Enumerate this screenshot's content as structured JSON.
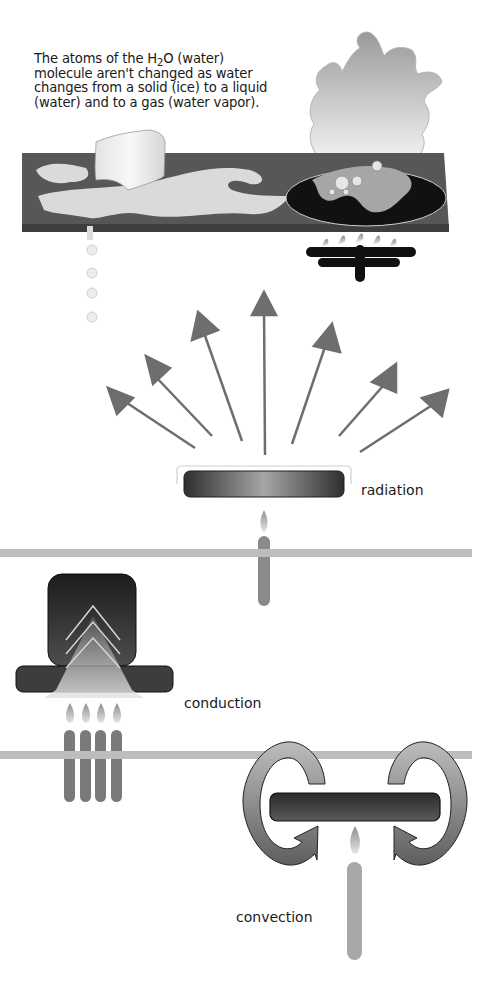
{
  "caption": {
    "prefix": "The atoms of the H",
    "subscript": "2",
    "line1_rest": "O (water)",
    "line2": "molecule aren't changed as water",
    "line3": "changes from a solid (ice) to a liquid",
    "line4": "(water) and to a gas (water vapor)."
  },
  "labels": {
    "radiation": "radiation",
    "conduction": "conduction",
    "convection": "convection"
  },
  "colors": {
    "background": "#ffffff",
    "plank": "#5a5a5a",
    "arrow": "#6e6e6e",
    "candle": "#8a8a8a",
    "shelf_line": "#bdbdbd",
    "dark_plate": "#2a2a2a"
  },
  "diagram": {
    "sections": [
      "states of water",
      "radiation",
      "conduction",
      "convection"
    ],
    "radiation_arrow_count": 7,
    "conduction_candle_count": 4,
    "water_drip_count": 4
  }
}
